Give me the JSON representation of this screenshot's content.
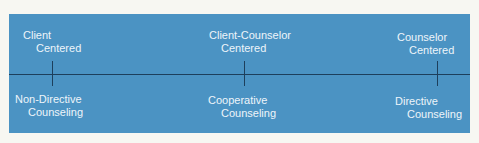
{
  "diagram": {
    "background_color": "#4b93c3",
    "line_color": "#1d3f5c",
    "text_color": "#eef5fa",
    "points": [
      {
        "top_label": [
          "Client",
          "Centered"
        ],
        "bottom_label": [
          "Non-Directive",
          "Counseling"
        ]
      },
      {
        "top_label": [
          "Client-Counselor",
          "Centered"
        ],
        "bottom_label": [
          "Cooperative",
          "Counseling"
        ]
      },
      {
        "top_label": [
          "Counselor",
          "Centered"
        ],
        "bottom_label": [
          "Directive",
          "Counseling"
        ]
      }
    ]
  }
}
